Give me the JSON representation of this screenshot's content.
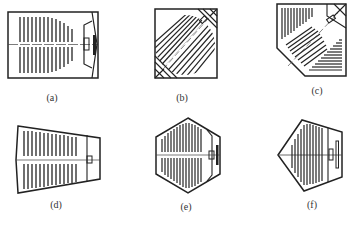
{
  "figures": [
    {
      "id": "a",
      "label": "(a)",
      "shape": "rectangle",
      "description": "rectangular hall, stage at right"
    },
    {
      "id": "b",
      "label": "(b)",
      "shape": "square-diagonal",
      "description": "square hall, stage at corner, diagonal seating"
    },
    {
      "id": "c",
      "label": "(c)",
      "shape": "cut-corner-square",
      "description": "square with chamfered corner, fan seating toward corner stage"
    },
    {
      "id": "d",
      "label": "(d)",
      "shape": "trapezoid",
      "description": "trapezoidal hall, stage at narrow right end"
    },
    {
      "id": "e",
      "label": "(e)",
      "shape": "hexagon",
      "description": "hexagonal hall, stage at right"
    },
    {
      "id": "f",
      "label": "(f)",
      "shape": "pentagon",
      "description": "pentagonal hall, stage at right"
    }
  ],
  "colors": {
    "line": "#222222",
    "background": "#ffffff"
  }
}
